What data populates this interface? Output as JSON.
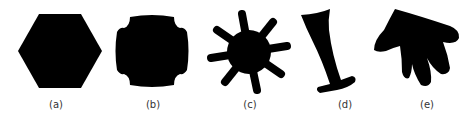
{
  "figure": {
    "panels": [
      {
        "label": "(a)",
        "shape": "hexagon"
      },
      {
        "label": "(b)",
        "shape": "square-with-four-notches"
      },
      {
        "label": "(c)",
        "shape": "eight-armed-star"
      },
      {
        "label": "(d)",
        "shape": "boot-like-tapered-shape"
      },
      {
        "label": "(e)",
        "shape": "hand-like-shape"
      }
    ],
    "fill_color": "#000000",
    "background": "#ffffff"
  }
}
